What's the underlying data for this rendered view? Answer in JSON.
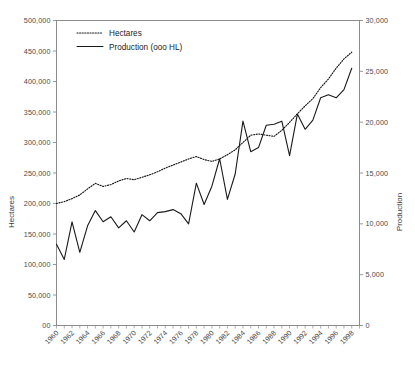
{
  "chart_data": {
    "type": "line",
    "title": "",
    "xlabel": "",
    "ylabel": "Hectares",
    "y2label": "Production",
    "grid": false,
    "legend_position": "top-left",
    "x": [
      1960,
      1961,
      1962,
      1963,
      1964,
      1965,
      1966,
      1967,
      1968,
      1969,
      1970,
      1971,
      1972,
      1973,
      1974,
      1975,
      1976,
      1977,
      1978,
      1979,
      1980,
      1981,
      1982,
      1983,
      1984,
      1985,
      1986,
      1987,
      1988,
      1989,
      1990,
      1991,
      1992,
      1993,
      1994,
      1995,
      1996,
      1997,
      1998
    ],
    "xlim": [
      1960,
      1999
    ],
    "xtick_labels": [
      "1960",
      "1962",
      "1964",
      "1966",
      "1968",
      "1970",
      "1972",
      "1974",
      "1976",
      "1978",
      "1980",
      "1982",
      "1984",
      "1986",
      "1988",
      "1990",
      "1992",
      "1994",
      "1996",
      "1998"
    ],
    "ylim": [
      0,
      500000
    ],
    "ytick_labels": [
      "00",
      "50,000",
      "100,000",
      "150,000",
      "200,000",
      "250,000",
      "300,000",
      "350,000",
      "400,000",
      "450,000",
      "500,000"
    ],
    "y2lim": [
      0,
      30000
    ],
    "y2tick_labels": [
      "0",
      "5,000",
      "10,000",
      "15,000",
      "20,000",
      "25,000",
      "30,000"
    ],
    "series": [
      {
        "name": "Hectares",
        "axis": "left",
        "style": "dotted",
        "values": [
          200000,
          203000,
          208000,
          214000,
          224000,
          233000,
          228000,
          231000,
          237000,
          241000,
          239000,
          243000,
          247000,
          252000,
          258000,
          263000,
          268000,
          273000,
          277000,
          272000,
          269000,
          273000,
          280000,
          288000,
          300000,
          312000,
          314000,
          312000,
          310000,
          320000,
          333000,
          347000,
          360000,
          372000,
          390000,
          404000,
          422000,
          437000,
          448000
        ]
      },
      {
        "name": "Production (ooo HL)",
        "axis": "right",
        "style": "solid",
        "values": [
          8000,
          6500,
          10200,
          7200,
          9800,
          11300,
          10200,
          10700,
          9600,
          10300,
          9200,
          10900,
          10300,
          11100,
          11200,
          11400,
          11000,
          10000,
          14000,
          11900,
          13700,
          16400,
          12400,
          14900,
          20100,
          17100,
          17500,
          19700,
          19800,
          20100,
          16700,
          20800,
          19300,
          20200,
          22400,
          22700,
          22400,
          23200,
          25300
        ]
      }
    ],
    "legend": [
      {
        "label": "Hectares",
        "style": "dotted"
      },
      {
        "label": "Production (ooo HL)",
        "style": "solid"
      }
    ]
  }
}
